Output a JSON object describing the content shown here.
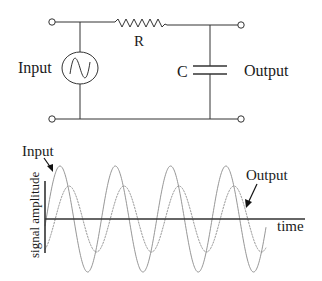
{
  "circuit": {
    "input_label": "Input",
    "output_label": "Output",
    "resistor_label": "R",
    "capacitor_label": "C"
  },
  "graph": {
    "input_label": "Input",
    "output_label": "Output",
    "x_axis_label": "time",
    "y_axis_label": "signal amplitude"
  },
  "colors": {
    "line": "#333333",
    "wave": "#8a8a8a",
    "text": "#1a1a1a",
    "background": "#ffffff"
  },
  "chart_data": {
    "type": "line",
    "title": "",
    "xlabel": "time",
    "ylabel": "signal amplitude",
    "grid": false,
    "series": [
      {
        "name": "Input",
        "amplitude": 1.0,
        "cycles_shown": 4,
        "phase_lag_deg": 0
      },
      {
        "name": "Output",
        "amplitude": 0.62,
        "cycles_shown": 4,
        "phase_lag_deg": 57
      }
    ],
    "render": {
      "axis_y": 219,
      "x_start": 45,
      "x_end": 266,
      "series_px": [
        {
          "name": "Input",
          "amp_px": 53,
          "peak_x": 60,
          "period_px": 55.3
        },
        {
          "name": "Output",
          "amp_px": 33,
          "peak_x": 69,
          "period_px": 55.0
        }
      ]
    }
  }
}
